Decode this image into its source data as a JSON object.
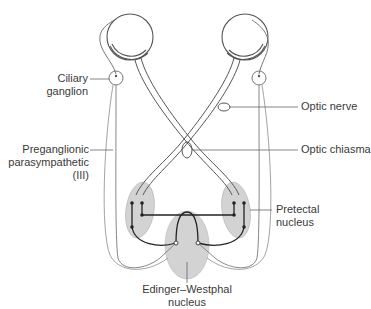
{
  "labels": {
    "ciliary_ganglion": [
      "Ciliary",
      "ganglion"
    ],
    "optic_nerve": "Optic nerve",
    "optic_chiasma": "Optic chiasma",
    "preganglionic": [
      "Preganglionic",
      "parasympathetic",
      "(III)"
    ],
    "pretectal_nucleus": [
      "Pretectal",
      "nucleus"
    ],
    "edinger_westphal": [
      "Edinger–Westphal",
      "nucleus"
    ]
  },
  "colors": {
    "line": "#555555",
    "dark_line": "#222222",
    "nucleus_fill": "#d3d3d3",
    "text": "#3a3a3a"
  }
}
